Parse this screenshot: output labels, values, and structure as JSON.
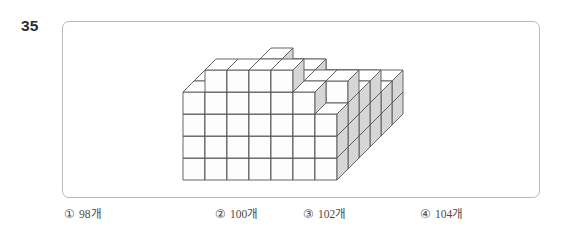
{
  "question": {
    "number": "35",
    "number_label": "35"
  },
  "figure": {
    "name": "isometric-cube-stack",
    "colors": {
      "outline": "#555555",
      "top_face": "#ffffff",
      "front_face": "#fdfdfd",
      "right_face": "#d6d6d6",
      "frame_border": "#b9b9b9"
    },
    "geometry": {
      "cube_width": 22,
      "cube_height": 22,
      "depth_dx": 11,
      "depth_dy": -11,
      "origin_x": 120,
      "origin_y": 158
    },
    "heights_grid": [
      [
        2,
        2,
        2,
        2,
        2,
        2,
        2
      ],
      [
        2,
        2,
        3,
        3,
        2,
        2,
        2
      ],
      [
        3,
        3,
        3,
        3,
        3,
        3,
        3
      ],
      [
        3,
        3,
        4,
        4,
        4,
        3,
        3
      ],
      [
        4,
        4,
        4,
        5,
        4,
        4,
        4
      ],
      [
        4,
        5,
        5,
        5,
        5,
        4,
        3
      ]
    ]
  },
  "options": [
    {
      "marker": "①",
      "text": "98개",
      "value": 98,
      "name": "option-1"
    },
    {
      "marker": "②",
      "text": "100개",
      "value": 100,
      "name": "option-2"
    },
    {
      "marker": "③",
      "text": "102개",
      "value": 102,
      "name": "option-3"
    },
    {
      "marker": "④",
      "text": "104개",
      "value": 104,
      "name": "option-4"
    }
  ]
}
